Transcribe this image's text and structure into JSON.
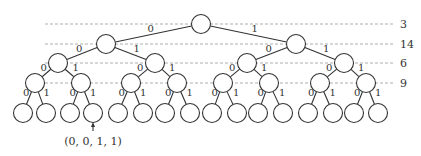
{
  "diagram": {
    "type": "binary-tree",
    "depth": 4,
    "edge_labels": {
      "left": "0",
      "right": "1"
    },
    "level_counts": [
      {
        "level": 0,
        "value": "3"
      },
      {
        "level": 1,
        "value": "14"
      },
      {
        "level": 2,
        "value": "6"
      },
      {
        "level": 3,
        "value": "9"
      }
    ],
    "annotation": {
      "label": "(0, 0, 1, 1)",
      "target_leaf_index": 3
    },
    "colors": {
      "stroke": "#333333",
      "guide": "#999999",
      "background": "#ffffff"
    }
  }
}
